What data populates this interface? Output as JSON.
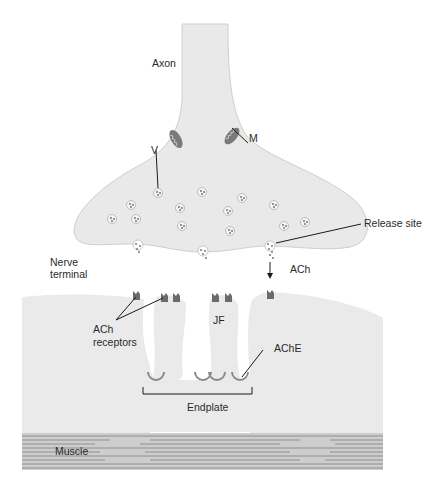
{
  "figure": {
    "type": "neuromuscular junction diagram",
    "colors": {
      "background": "#ffffff",
      "cell_fill": "#e9e9e9",
      "cell_edge": "#c9c9c9",
      "muscle_fill": "#c8c8c8",
      "muscle_stripe": "#8f8f8f",
      "receptor": "#6a6a6a",
      "ache": "#8a8a8a",
      "leader_line": "#1a1a1a"
    },
    "labels": {
      "axon": "Axon",
      "vesicle": "V",
      "mitochondrion": "M",
      "release_site": "Release site",
      "nerve_terminal_line1": "Nerve",
      "nerve_terminal_line2": "terminal",
      "ach": "ACh",
      "ach_receptors_line1": "ACh",
      "ach_receptors_line2": "receptors",
      "junctional_fold": "JF",
      "ache": "AChE",
      "endplate": "Endplate",
      "muscle": "Muscle"
    }
  }
}
